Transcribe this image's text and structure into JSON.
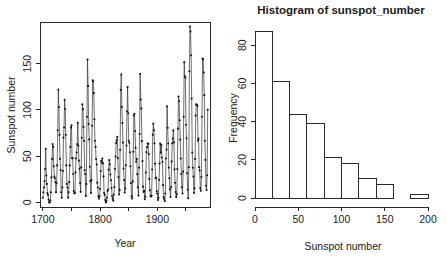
{
  "figure": {
    "background": "#ffffff",
    "foreground": "#1a1a1a",
    "panel_count": 2
  },
  "panels": {
    "timeseries": {
      "name": "sunspot-time-series",
      "title": "",
      "xlabel": "Year",
      "ylabel": "Sunspot number"
    },
    "histogram": {
      "name": "sunspot-histogram",
      "title": "Histogram of sunspot_number",
      "xlabel": "Sunspot number",
      "ylabel": "Frequency"
    }
  },
  "chart_data": [
    {
      "type": "line",
      "title": "",
      "xlabel": "Year",
      "ylabel": "Sunspot number",
      "xlim": [
        1695,
        1992
      ],
      "ylim": [
        -5,
        195
      ],
      "xticks": [
        1700,
        1800,
        1900
      ],
      "xticklabels": [
        "1700",
        "1800",
        "1900"
      ],
      "xminorticks": [
        1750,
        1850,
        1950
      ],
      "yticks": [
        0,
        50,
        100,
        150
      ],
      "yticklabels": [
        "0",
        "50",
        "100",
        "150"
      ],
      "grid": false,
      "legend": "none",
      "marker": "point",
      "line_color": "#303030",
      "point_color": "#151515",
      "x": [
        1700,
        1701,
        1702,
        1703,
        1704,
        1705,
        1706,
        1707,
        1708,
        1709,
        1710,
        1711,
        1712,
        1713,
        1714,
        1715,
        1716,
        1717,
        1718,
        1719,
        1720,
        1721,
        1722,
        1723,
        1724,
        1725,
        1726,
        1727,
        1728,
        1729,
        1730,
        1731,
        1732,
        1733,
        1734,
        1735,
        1736,
        1737,
        1738,
        1739,
        1740,
        1741,
        1742,
        1743,
        1744,
        1745,
        1746,
        1747,
        1748,
        1749,
        1750,
        1751,
        1752,
        1753,
        1754,
        1755,
        1756,
        1757,
        1758,
        1759,
        1760,
        1761,
        1762,
        1763,
        1764,
        1765,
        1766,
        1767,
        1768,
        1769,
        1770,
        1771,
        1772,
        1773,
        1774,
        1775,
        1776,
        1777,
        1778,
        1779,
        1780,
        1781,
        1782,
        1783,
        1784,
        1785,
        1786,
        1787,
        1788,
        1789,
        1790,
        1791,
        1792,
        1793,
        1794,
        1795,
        1796,
        1797,
        1798,
        1799,
        1800,
        1801,
        1802,
        1803,
        1804,
        1805,
        1806,
        1807,
        1808,
        1809,
        1810,
        1811,
        1812,
        1813,
        1814,
        1815,
        1816,
        1817,
        1818,
        1819,
        1820,
        1821,
        1822,
        1823,
        1824,
        1825,
        1826,
        1827,
        1828,
        1829,
        1830,
        1831,
        1832,
        1833,
        1834,
        1835,
        1836,
        1837,
        1838,
        1839,
        1840,
        1841,
        1842,
        1843,
        1844,
        1845,
        1846,
        1847,
        1848,
        1849,
        1850,
        1851,
        1852,
        1853,
        1854,
        1855,
        1856,
        1857,
        1858,
        1859,
        1860,
        1861,
        1862,
        1863,
        1864,
        1865,
        1866,
        1867,
        1868,
        1869,
        1870,
        1871,
        1872,
        1873,
        1874,
        1875,
        1876,
        1877,
        1878,
        1879,
        1880,
        1881,
        1882,
        1883,
        1884,
        1885,
        1886,
        1887,
        1888,
        1889,
        1890,
        1891,
        1892,
        1893,
        1894,
        1895,
        1896,
        1897,
        1898,
        1899,
        1900,
        1901,
        1902,
        1903,
        1904,
        1905,
        1906,
        1907,
        1908,
        1909,
        1910,
        1911,
        1912,
        1913,
        1914,
        1915,
        1916,
        1917,
        1918,
        1919,
        1920,
        1921,
        1922,
        1923,
        1924,
        1925,
        1926,
        1927,
        1928,
        1929,
        1930,
        1931,
        1932,
        1933,
        1934,
        1935,
        1936,
        1937,
        1938,
        1939,
        1940,
        1941,
        1942,
        1943,
        1944,
        1945,
        1946,
        1947,
        1948,
        1949,
        1950,
        1951,
        1952,
        1953,
        1954,
        1955,
        1956,
        1957,
        1958,
        1959,
        1960,
        1961,
        1962,
        1963,
        1964,
        1965,
        1966,
        1967,
        1968,
        1969,
        1970,
        1971,
        1972,
        1973,
        1974,
        1975,
        1976,
        1977,
        1978,
        1979,
        1980,
        1981,
        1982,
        1983,
        1984,
        1985,
        1986,
        1987,
        1988
      ],
      "y": [
        5,
        11,
        16,
        23,
        36,
        58,
        29,
        20,
        10,
        8,
        3,
        0,
        0,
        2,
        11,
        27,
        47,
        63,
        60,
        39,
        28,
        26,
        22,
        11,
        21,
        40,
        78,
        122,
        103,
        73,
        47,
        35,
        11,
        5,
        16,
        34,
        70,
        81,
        111,
        101,
        73,
        40,
        20,
        16,
        5,
        11,
        22,
        40,
        60,
        80.9,
        83.4,
        47.7,
        47.8,
        30.7,
        12.2,
        9.6,
        10.2,
        32.4,
        47.6,
        54,
        62.9,
        85.9,
        61.2,
        45.1,
        36.4,
        20.9,
        11.4,
        37.8,
        69.8,
        106.1,
        100.8,
        81.6,
        66.5,
        34.8,
        30.6,
        7,
        19.8,
        92.5,
        154.4,
        125.9,
        84.8,
        68.1,
        38.5,
        22.8,
        10.2,
        24.1,
        82.9,
        132,
        130.9,
        118.1,
        89.9,
        66.6,
        60,
        46.9,
        41,
        21.3,
        16,
        6.4,
        4.1,
        6.8,
        14.5,
        34,
        45,
        43.1,
        47.5,
        42.2,
        28.1,
        10.1,
        8.1,
        2.5,
        0,
        1.4,
        5,
        12.2,
        13.9,
        35.4,
        45.8,
        41.1,
        30.1,
        23.9,
        15.6,
        6.6,
        4,
        1.8,
        8.5,
        16.6,
        36.3,
        49.6,
        64.2,
        67,
        70.9,
        47.8,
        27.5,
        8.5,
        13.2,
        56.9,
        121.5,
        138.3,
        103.2,
        85.7,
        64.6,
        36.7,
        24.2,
        10.7,
        15,
        40.1,
        61.5,
        98.5,
        124.7,
        96.3,
        66.6,
        64.5,
        54.1,
        39,
        20.6,
        6.7,
        4.3,
        22.7,
        54.8,
        93.8,
        95.8,
        77.2,
        59.1,
        44,
        47,
        30.5,
        16.3,
        7.3,
        37.6,
        74,
        139,
        111.2,
        101.6,
        66.2,
        44.7,
        17,
        11.3,
        12.4,
        3.4,
        6,
        32.3,
        54.3,
        59.7,
        63.7,
        63.5,
        52.2,
        25.4,
        13.1,
        6.8,
        6.3,
        7.1,
        35.6,
        73,
        85.1,
        78,
        64,
        41.8,
        26.2,
        26.7,
        12.1,
        9.5,
        2.7,
        5,
        24.4,
        42,
        63.5,
        53.8,
        62,
        48.5,
        43.9,
        18.6,
        5.7,
        3.6,
        1.4,
        9.6,
        47.4,
        57.1,
        103.9,
        80.6,
        63.6,
        37.6,
        26.1,
        14.2,
        5.8,
        16.7,
        44.3,
        63.9,
        69,
        77.8,
        64.9,
        35.7,
        21.2,
        11.1,
        5.7,
        8.7,
        36.1,
        79.7,
        114.4,
        109.6,
        88.8,
        67.8,
        47.5,
        30.6,
        16.3,
        9.6,
        33.2,
        92.6,
        151.6,
        136.3,
        134.7,
        83.9,
        69.4,
        31.5,
        13.9,
        4.4,
        38,
        141.7,
        190.2,
        184.8,
        159,
        112.3,
        53.9,
        37.5,
        27.9,
        10.2,
        15.1,
        47,
        93.8,
        105.9,
        105.5,
        104.5,
        66.6,
        68.9,
        38,
        34.5,
        15.5,
        12.6,
        27.5,
        92.5,
        155.4,
        154.6,
        140.4,
        115.9,
        66.6,
        45.9,
        17.9,
        13.4,
        29.4,
        100.2
      ]
    },
    {
      "type": "bar",
      "subtype": "histogram",
      "title": "Histogram of sunspot_number",
      "xlabel": "Sunspot number",
      "ylabel": "Frequency",
      "xlim": [
        0,
        200
      ],
      "ylim": [
        0,
        88
      ],
      "xticks": [
        0,
        50,
        100,
        150,
        200
      ],
      "xticklabels": [
        "0",
        "50",
        "100",
        "150",
        "200"
      ],
      "yticks": [
        0,
        20,
        40,
        60,
        80
      ],
      "yticklabels": [
        "0",
        "20",
        "40",
        "60",
        "80"
      ],
      "grid": false,
      "legend": "none",
      "binwidth": 20,
      "bin_edges": [
        0,
        20,
        40,
        60,
        80,
        100,
        120,
        140,
        160,
        180,
        200
      ],
      "bin_labels": [
        "0-20",
        "20-40",
        "40-60",
        "60-80",
        "80-100",
        "100-120",
        "120-140",
        "140-160",
        "160-180",
        "180-200"
      ],
      "values": [
        87,
        61,
        44,
        39,
        21,
        18,
        10,
        7,
        0,
        2
      ],
      "bar_fill": "#ffffff",
      "bar_stroke": "#2a2a2a"
    }
  ]
}
